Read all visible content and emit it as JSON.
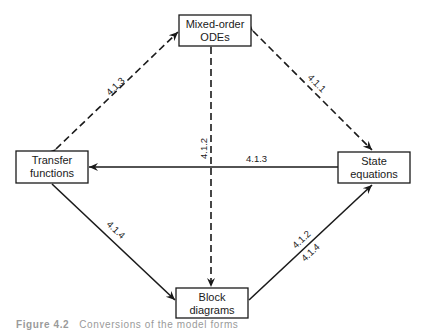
{
  "diagram": {
    "nodes": {
      "mixed_order_odes": {
        "line1": "Mixed-order",
        "line2": "ODEs"
      },
      "transfer_functions": {
        "line1": "Transfer",
        "line2": "functions"
      },
      "state_equations": {
        "line1": "State",
        "line2": "equations"
      },
      "block_diagrams": {
        "line1": "Block",
        "line2": "diagrams"
      }
    },
    "edges": {
      "odes_transfer": {
        "label": "4.1.3",
        "style": "dashed",
        "direction": "bidirectional"
      },
      "odes_state": {
        "label": "4.1.1",
        "style": "dashed",
        "direction": "bidirectional"
      },
      "odes_block": {
        "label": "4.1.2",
        "style": "dashed",
        "direction": "bidirectional"
      },
      "state_to_transfer": {
        "label": "4.1.3",
        "style": "solid",
        "direction": "state-equations to transfer-functions"
      },
      "transfer_to_block": {
        "label": "4.1.4",
        "style": "solid",
        "direction": "transfer-functions to block-diagrams"
      },
      "block_to_state": {
        "label_a": "4.1.2",
        "label_b": "4.1.4",
        "style": "solid",
        "direction": "block-diagrams to state-equations"
      }
    }
  },
  "caption": {
    "figure_number": "Figure 4.2",
    "text": "Conversions of the model forms"
  },
  "colors": {
    "ink": "#1a1a1a",
    "background": "#ffffff",
    "caption": "#9a9a9a"
  }
}
